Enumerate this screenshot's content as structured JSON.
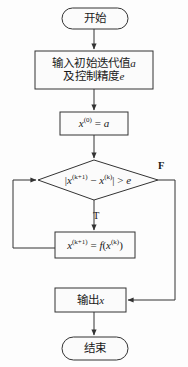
{
  "diagram": {
    "type": "flowchart",
    "line_color": "#333333",
    "fill_color": "#fbfbfb",
    "nodes": {
      "start": {
        "shape": "terminator",
        "text": "开始"
      },
      "input": {
        "shape": "process",
        "line1": "输入初始迭代值",
        "var1": "a",
        "line2": "及控制精度",
        "var2": "e"
      },
      "init": {
        "shape": "process",
        "var": "x",
        "sup": "(0)",
        "eq": " = ",
        "value": "a"
      },
      "decision": {
        "shape": "diamond",
        "bar_open": "|",
        "var1": "x",
        "sup1": "(k+1)",
        "minus": " − ",
        "var2": "x",
        "sup2": "(k)",
        "bar_close": "|",
        "op": " > ",
        "eps": "e"
      },
      "iterate": {
        "shape": "process",
        "var1": "x",
        "sup1": "(k+1)",
        "eq": " = ",
        "fn": "f",
        "paren_open": "(",
        "var2": "x",
        "sup2": "(k)",
        "paren_close": ")"
      },
      "output": {
        "shape": "process",
        "text": "输出",
        "var": "x"
      },
      "end": {
        "shape": "terminator",
        "text": "结束"
      }
    },
    "branches": {
      "true_label": "T",
      "false_label": "F"
    }
  }
}
